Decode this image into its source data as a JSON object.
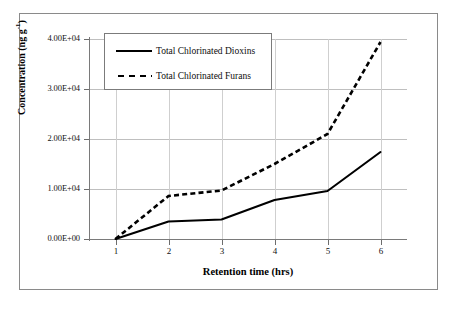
{
  "chart_data": {
    "type": "line",
    "title": "",
    "xlabel": "Retention time (hrs)",
    "ylabel": "Concentration (ng g-1)",
    "ylabel_base": "Concentration (ng g",
    "ylabel_sup": "-1",
    "ylabel_close": ")",
    "x": [
      1,
      2,
      3,
      4,
      5,
      6
    ],
    "xlim": [
      0.5,
      6.5
    ],
    "ylim": [
      0,
      40000
    ],
    "grid": true,
    "legend_position": "upper-left-inside",
    "x_tick_labels": [
      "1",
      "2",
      "3",
      "4",
      "5",
      "6"
    ],
    "y_tick_labels": [
      "0.00E+00",
      "1.00E+04",
      "2.00E+04",
      "3.00E+04",
      "4.00E+04"
    ],
    "y_tick_values": [
      0,
      10000,
      20000,
      30000,
      40000
    ],
    "series": [
      {
        "name": "Total Chlorinated Dioxins",
        "style": "solid",
        "color": "#000000",
        "values": [
          0,
          3500,
          3900,
          7800,
          9600,
          17400
        ]
      },
      {
        "name": "Total Chlorinated Furans",
        "style": "dashed",
        "color": "#000000",
        "values": [
          0,
          8600,
          9700,
          15000,
          21000,
          39400
        ]
      }
    ]
  },
  "legend": {
    "items": [
      {
        "label": "Total Chlorinated Dioxins",
        "style": "solid"
      },
      {
        "label": "Total Chlorinated Furans",
        "style": "dashed"
      }
    ]
  },
  "axes": {
    "x_title": "Retention time (hrs)",
    "y_title_base": "Concentration (ng g",
    "y_title_sup": "-1",
    "y_title_close": ")",
    "x_ticks": [
      "1",
      "2",
      "3",
      "4",
      "5",
      "6"
    ],
    "y_ticks": [
      "0.00E+00",
      "1.00E+04",
      "2.00E+04",
      "3.00E+04",
      "4.00E+04"
    ]
  },
  "colors": {
    "ink": "#000000",
    "grid": "#bfbfbf",
    "axis": "#7a7a7a",
    "frame": "#8a8a8a",
    "background": "#ffffff"
  }
}
